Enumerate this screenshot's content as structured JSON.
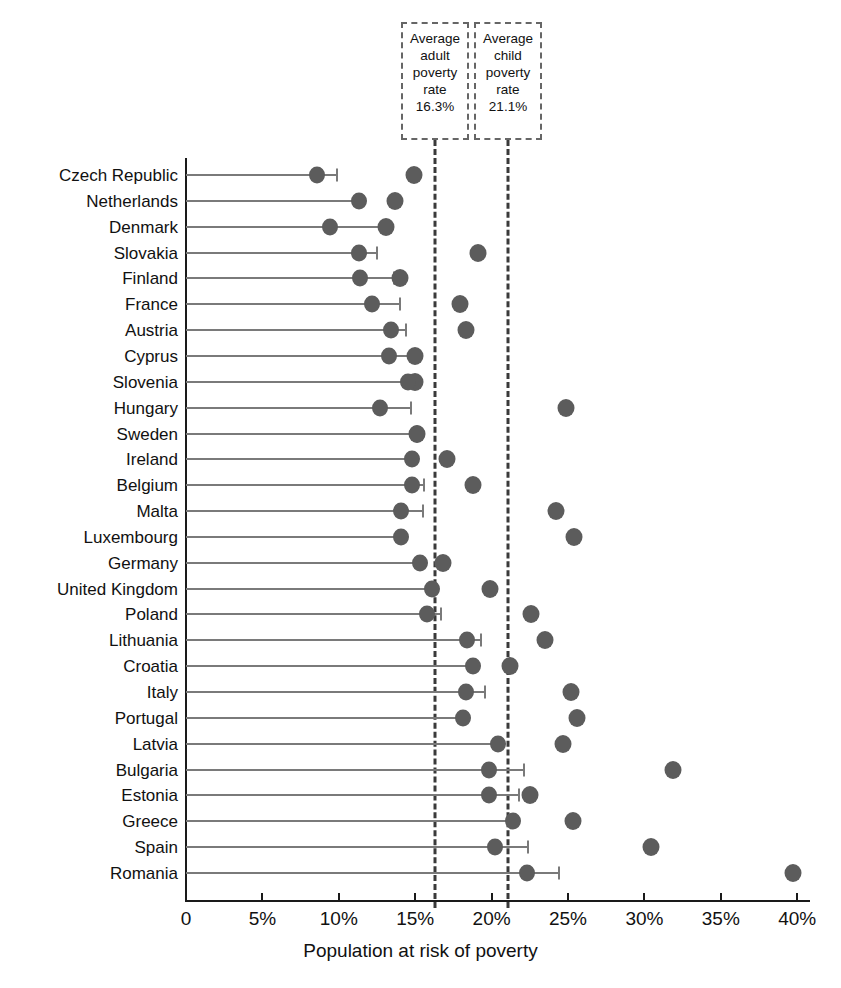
{
  "chart_data": {
    "type": "scatter",
    "title": "",
    "xlabel": "Population at risk of poverty",
    "ylabel": "",
    "xlim": [
      0,
      40
    ],
    "xticks": [
      0,
      5,
      10,
      15,
      20,
      25,
      30,
      35,
      40
    ],
    "xtick_labels": [
      "0",
      "5%",
      "10%",
      "15%",
      "20%",
      "25%",
      "30%",
      "35%",
      "40%"
    ],
    "grid": false,
    "legend": "none",
    "series": [
      {
        "name": "Adult poverty rate",
        "key": "adult"
      },
      {
        "name": "Child poverty rate",
        "key": "child"
      },
      {
        "name": "Range cap",
        "key": "cap"
      }
    ],
    "categories": [
      "Czech Republic",
      "Netherlands",
      "Denmark",
      "Slovakia",
      "Finland",
      "France",
      "Austria",
      "Cyprus",
      "Slovenia",
      "Hungary",
      "Sweden",
      "Ireland",
      "Belgium",
      "Malta",
      "Luxembourg",
      "Germany",
      "United Kingdom",
      "Poland",
      "Lithuania",
      "Croatia",
      "Italy",
      "Portugal",
      "Latvia",
      "Bulgaria",
      "Estonia",
      "Greece",
      "Spain",
      "Romania"
    ],
    "rows": [
      {
        "country": "Czech Republic",
        "adult": 8.6,
        "cap": 9.9,
        "child": 14.9
      },
      {
        "country": "Netherlands",
        "adult": 11.3,
        "cap": 11.3,
        "child": 13.7
      },
      {
        "country": "Denmark",
        "adult": 9.4,
        "cap": 12.9,
        "child": 13.1
      },
      {
        "country": "Slovakia",
        "adult": 11.3,
        "cap": 12.5,
        "child": 19.1
      },
      {
        "country": "Finland",
        "adult": 11.4,
        "cap": 13.6,
        "child": 14.0
      },
      {
        "country": "France",
        "adult": 12.2,
        "cap": 14.0,
        "child": 17.9
      },
      {
        "country": "Austria",
        "adult": 13.4,
        "cap": 14.4,
        "child": 18.3
      },
      {
        "country": "Cyprus",
        "adult": 13.3,
        "cap": 14.9,
        "child": 15.0
      },
      {
        "country": "Slovenia",
        "adult": 14.5,
        "cap": 14.5,
        "child": 15.0
      },
      {
        "country": "Hungary",
        "adult": 12.7,
        "cap": 14.7,
        "child": 24.9
      },
      {
        "country": "Sweden",
        "adult": 15.1,
        "cap": 15.1,
        "child": 15.1
      },
      {
        "country": "Ireland",
        "adult": 14.8,
        "cap": 14.8,
        "child": 17.1
      },
      {
        "country": "Belgium",
        "adult": 14.8,
        "cap": 15.6,
        "child": 18.8
      },
      {
        "country": "Malta",
        "adult": 14.1,
        "cap": 15.5,
        "child": 24.2
      },
      {
        "country": "Luxembourg",
        "adult": 14.1,
        "cap": 14.1,
        "child": 25.4
      },
      {
        "country": "Germany",
        "adult": 15.3,
        "cap": 15.3,
        "child": 16.8
      },
      {
        "country": "United Kingdom",
        "adult": 16.1,
        "cap": 16.1,
        "child": 19.9
      },
      {
        "country": "Poland",
        "adult": 15.8,
        "cap": 16.7,
        "child": 22.6
      },
      {
        "country": "Lithuania",
        "adult": 18.4,
        "cap": 19.3,
        "child": 23.5
      },
      {
        "country": "Croatia",
        "adult": 18.8,
        "cap": 18.8,
        "child": 21.2
      },
      {
        "country": "Italy",
        "adult": 18.3,
        "cap": 19.6,
        "child": 25.2
      },
      {
        "country": "Portugal",
        "adult": 18.1,
        "cap": 18.1,
        "child": 25.6
      },
      {
        "country": "Latvia",
        "adult": 20.4,
        "cap": 20.4,
        "child": 24.7
      },
      {
        "country": "Bulgaria",
        "adult": 19.8,
        "cap": 22.1,
        "child": 31.9
      },
      {
        "country": "Estonia",
        "adult": 19.8,
        "cap": 21.8,
        "child": 22.5
      },
      {
        "country": "Greece",
        "adult": 21.4,
        "cap": 21.4,
        "child": 25.3
      },
      {
        "country": "Spain",
        "adult": 20.2,
        "cap": 22.4,
        "child": 30.4
      },
      {
        "country": "Romania",
        "adult": 22.3,
        "cap": 24.4,
        "child": 39.7
      }
    ],
    "annotations": [
      {
        "id": "adult-average",
        "lines": [
          "Average",
          "adult",
          "poverty",
          "rate",
          "16.3%"
        ],
        "value": 16.3
      },
      {
        "id": "child-average",
        "lines": [
          "Average",
          "child",
          "poverty",
          "rate",
          "21.1%"
        ],
        "value": 21.1
      }
    ],
    "reference_lines": [
      {
        "name": "average-adult-poverty-rate",
        "value": 16.3
      },
      {
        "name": "average-child-poverty-rate",
        "value": 21.1
      }
    ],
    "colors": {
      "marker": "#5c5c5c",
      "line": "#7a7a7a",
      "axis": "#1a1a1a",
      "dashed": "#3a3a3a"
    }
  }
}
